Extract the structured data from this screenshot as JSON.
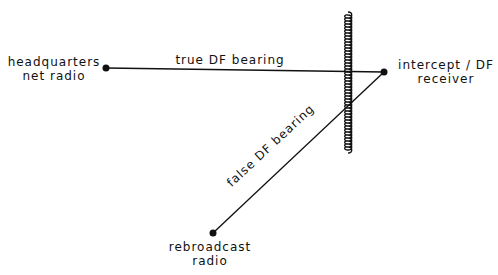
{
  "nodes": {
    "hq": {
      "line1": "headquarters",
      "line2": "net radio"
    },
    "receiver": {
      "line1": "intercept / DF",
      "line2": "receiver"
    },
    "rebroadcast": {
      "line1": "rebroadcast",
      "line2": "radio"
    }
  },
  "edges": {
    "true_bearing": "true DF bearing",
    "false_bearing": "false DF bearing"
  },
  "colors": {
    "ink": "#111111",
    "background": "#ffffff"
  }
}
